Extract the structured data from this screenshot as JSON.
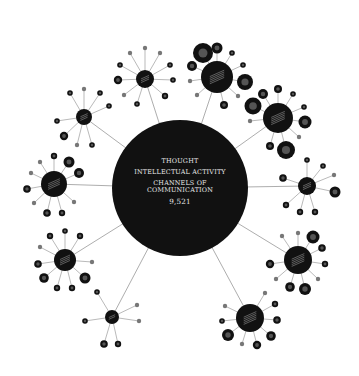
{
  "center": {
    "cx": 180,
    "cy": 188,
    "r": 68,
    "line1": "THOUGHT",
    "line2": "INTELLECTUAL ACTIVITY",
    "line3a": "CHANNELS OF",
    "line3b": "COMMUNICATION",
    "count": "9,521"
  },
  "colors": {
    "node": "#111111",
    "line": "#8a8a8a",
    "ring": "#666666",
    "label": "#bbbbbb"
  },
  "hubs": [
    {
      "cx": 145,
      "cy": 79,
      "r": 9,
      "spokes": [
        [
          145,
          48,
          2.2
        ],
        [
          160,
          53,
          2.2
        ],
        [
          170,
          65,
          2.8
        ],
        [
          173,
          80,
          2.8
        ],
        [
          165,
          96,
          3.2
        ],
        [
          137,
          104,
          2.8
        ],
        [
          124,
          95,
          2.2
        ],
        [
          118,
          80,
          4.2
        ],
        [
          120,
          65,
          2.8
        ],
        [
          130,
          53,
          2.2
        ]
      ]
    },
    {
      "cx": 84,
      "cy": 117,
      "r": 8,
      "spokes": [
        [
          84,
          89,
          2.2
        ],
        [
          100,
          93,
          2.8
        ],
        [
          109,
          106,
          2.8
        ],
        [
          92,
          145,
          2.8
        ],
        [
          77,
          145,
          2.2
        ],
        [
          64,
          136,
          4.2
        ],
        [
          57,
          121,
          2.8
        ],
        [
          70,
          93,
          2.8
        ]
      ]
    },
    {
      "cx": 217,
      "cy": 77,
      "r": 16,
      "spokes": [
        [
          203,
          53,
          10
        ],
        [
          217,
          48,
          5.5
        ],
        [
          192,
          66,
          5
        ],
        [
          190,
          81,
          2.2
        ],
        [
          197,
          95,
          2.2
        ],
        [
          224,
          105,
          4
        ],
        [
          238,
          96,
          2.2
        ],
        [
          245,
          82,
          8
        ],
        [
          243,
          65,
          2.8
        ],
        [
          232,
          53,
          2.8
        ]
      ]
    },
    {
      "cx": 278,
      "cy": 118,
      "r": 15,
      "spokes": [
        [
          253,
          106,
          8.5
        ],
        [
          263,
          94,
          5
        ],
        [
          278,
          89,
          4
        ],
        [
          293,
          94,
          2.8
        ],
        [
          304,
          107,
          2.8
        ],
        [
          305,
          122,
          6.5
        ],
        [
          299,
          137,
          2.2
        ],
        [
          286,
          150,
          9
        ],
        [
          270,
          146,
          4
        ],
        [
          250,
          121,
          2.2
        ]
      ]
    },
    {
      "cx": 307,
      "cy": 186,
      "r": 9,
      "spokes": [
        [
          307,
          160,
          2.8
        ],
        [
          323,
          166,
          2.8
        ],
        [
          334,
          175,
          2.2
        ],
        [
          335,
          192,
          5.5
        ],
        [
          315,
          212,
          3.2
        ],
        [
          300,
          212,
          3.2
        ],
        [
          286,
          205,
          3.2
        ],
        [
          283,
          178,
          3.8
        ]
      ]
    },
    {
      "cx": 298,
      "cy": 260,
      "r": 14,
      "spokes": [
        [
          282,
          236,
          2.2
        ],
        [
          298,
          233,
          2.2
        ],
        [
          313,
          237,
          6.5
        ],
        [
          322,
          248,
          3.8
        ],
        [
          325,
          264,
          3.2
        ],
        [
          318,
          279,
          2.2
        ],
        [
          305,
          289,
          6
        ],
        [
          290,
          287,
          4.8
        ],
        [
          276,
          279,
          2.2
        ],
        [
          270,
          264,
          4.2
        ]
      ]
    },
    {
      "cx": 250,
      "cy": 318,
      "r": 14,
      "spokes": [
        [
          265,
          293,
          2.2
        ],
        [
          275,
          304,
          3.2
        ],
        [
          277,
          320,
          3.8
        ],
        [
          271,
          336,
          4.8
        ],
        [
          257,
          345,
          4.2
        ],
        [
          242,
          344,
          2.2
        ],
        [
          228,
          335,
          6
        ],
        [
          222,
          321,
          2.8
        ],
        [
          225,
          306,
          2.2
        ]
      ]
    },
    {
      "cx": 112,
      "cy": 317,
      "r": 7,
      "spokes": [
        [
          97,
          292,
          2.8
        ],
        [
          137,
          305,
          2.2
        ],
        [
          139,
          321,
          2.2
        ],
        [
          118,
          344,
          3.2
        ],
        [
          104,
          344,
          3.8
        ],
        [
          85,
          321,
          2.8
        ]
      ]
    },
    {
      "cx": 65,
      "cy": 260,
      "r": 11,
      "spokes": [
        [
          65,
          231,
          2.8
        ],
        [
          80,
          236,
          3.2
        ],
        [
          92,
          262,
          2.2
        ],
        [
          85,
          278,
          5.5
        ],
        [
          72,
          288,
          3.2
        ],
        [
          57,
          288,
          3.2
        ],
        [
          44,
          278,
          4.8
        ],
        [
          38,
          264,
          3.8
        ],
        [
          40,
          247,
          2.2
        ],
        [
          50,
          236,
          3.2
        ]
      ]
    },
    {
      "cx": 54,
      "cy": 184,
      "r": 13,
      "spokes": [
        [
          54,
          156,
          3.2
        ],
        [
          69,
          162,
          5.5
        ],
        [
          79,
          173,
          5
        ],
        [
          74,
          202,
          2.2
        ],
        [
          62,
          213,
          3.2
        ],
        [
          47,
          213,
          3.8
        ],
        [
          34,
          203,
          2.2
        ],
        [
          27,
          189,
          3.8
        ],
        [
          31,
          173,
          2.2
        ],
        [
          40,
          162,
          2.2
        ]
      ]
    }
  ]
}
